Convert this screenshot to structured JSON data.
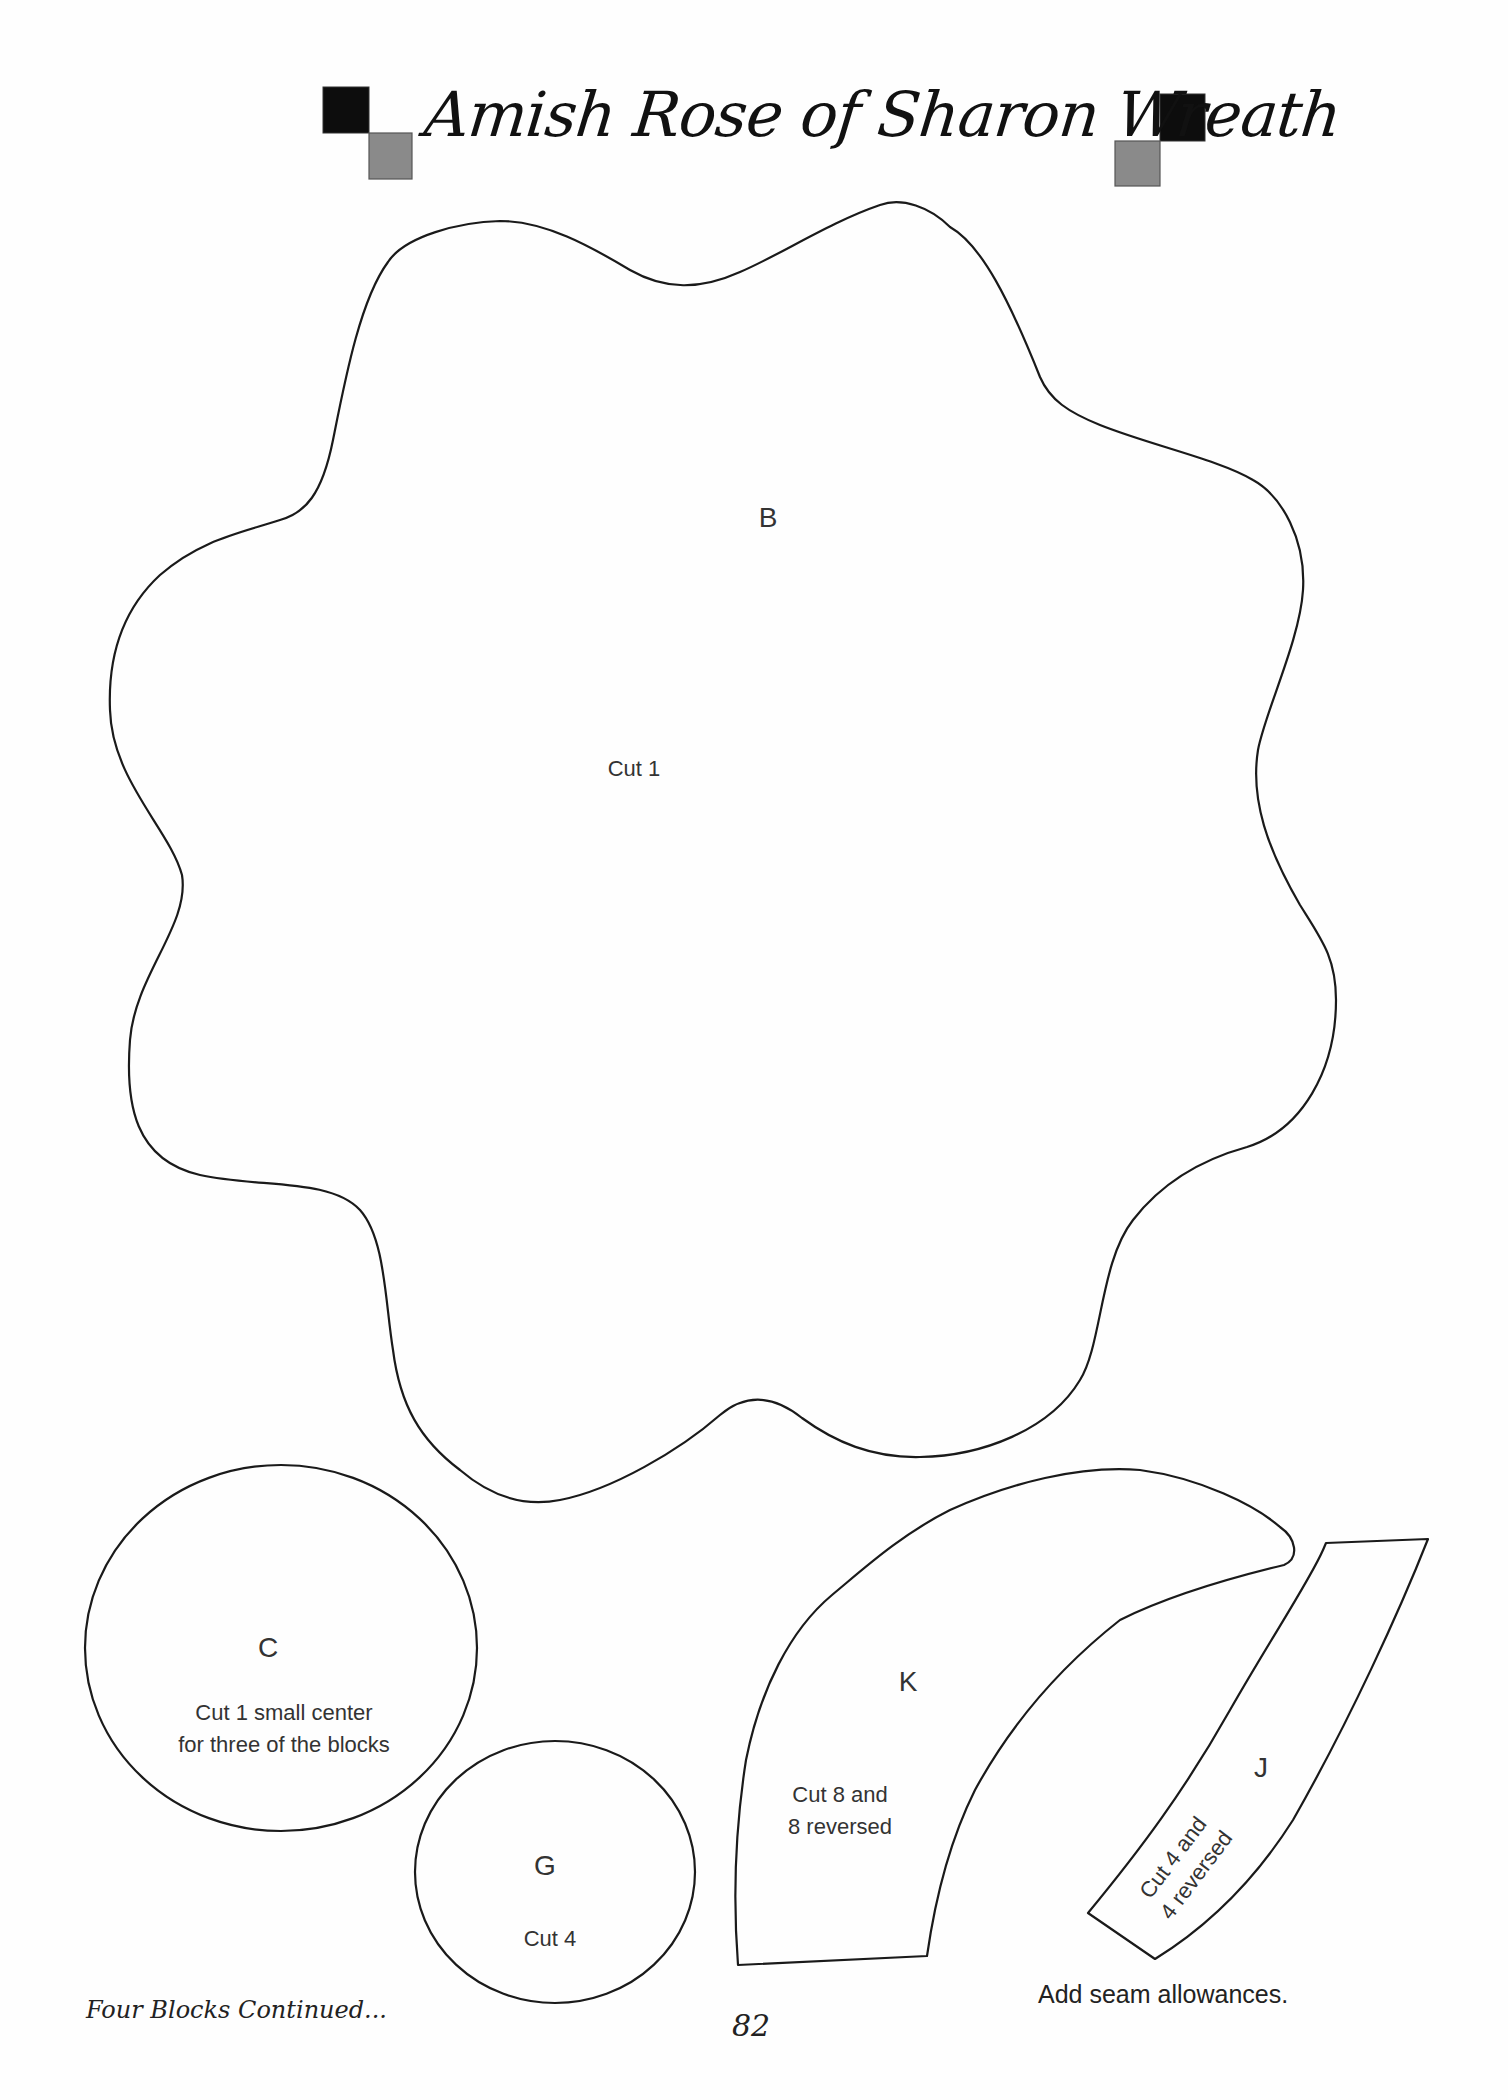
{
  "page": {
    "title": "Amish Rose of Sharon Wreath",
    "footer_left": "Four Blocks Continued...",
    "page_number": "82",
    "seam_note": "Add seam allowances.",
    "colors": {
      "square_dark": "#0d0d0d",
      "square_gray": "#8a8a8a",
      "outline": "#1a1a1a"
    }
  },
  "pieces": {
    "B": {
      "letter": "B",
      "note": "Cut 1"
    },
    "C": {
      "letter": "C",
      "note_line1": "Cut 1 small center",
      "note_line2": "for three of the blocks"
    },
    "G": {
      "letter": "G",
      "note": "Cut 4"
    },
    "K": {
      "letter": "K",
      "note_line1": "Cut 8 and",
      "note_line2": "8 reversed"
    },
    "J": {
      "letter": "J",
      "note_line1": "Cut 4 and",
      "note_line2": "4 reversed"
    }
  }
}
